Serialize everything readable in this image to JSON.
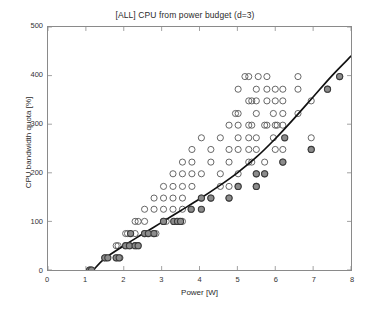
{
  "chart_data": {
    "type": "scatter",
    "title": "[ALL] CPU from power budget (d=3)",
    "xlabel": "Power [W]",
    "ylabel": "CPU bandwidth quota [%]",
    "xlim": [
      0,
      8
    ],
    "ylim": [
      0,
      500
    ],
    "xticks": [
      0,
      1,
      2,
      3,
      4,
      5,
      6,
      7,
      8
    ],
    "yticks": [
      0,
      100,
      200,
      300,
      400,
      500
    ],
    "xtick_labels": [
      "0",
      "1",
      "2",
      "3",
      "4",
      "5",
      "6",
      "7",
      "8"
    ],
    "ytick_labels": [
      "0",
      "100",
      "200",
      "300",
      "400",
      "500"
    ],
    "grid": false,
    "legend": "none",
    "colors": {
      "open_marker_edge": "#555555",
      "filled_marker_face": "#8c8c8c",
      "filled_marker_edge": "#3a3a3a",
      "fit_curve": "#111111",
      "axis": "#8a8a8a",
      "background": "#ffffff",
      "text": "#2b2b2b"
    },
    "series": [
      {
        "name": "all samples",
        "marker": "open-circle",
        "points": [
          [
            1.1,
            0
          ],
          [
            1.15,
            0
          ],
          [
            1.5,
            25
          ],
          [
            1.55,
            25
          ],
          [
            1.8,
            25
          ],
          [
            1.85,
            25
          ],
          [
            1.9,
            25
          ],
          [
            1.8,
            50
          ],
          [
            1.85,
            50
          ],
          [
            2.05,
            50
          ],
          [
            2.15,
            50
          ],
          [
            2.3,
            50
          ],
          [
            2.38,
            50
          ],
          [
            2.05,
            75
          ],
          [
            2.1,
            75
          ],
          [
            2.3,
            75
          ],
          [
            2.55,
            75
          ],
          [
            2.62,
            75
          ],
          [
            2.78,
            75
          ],
          [
            2.85,
            75
          ],
          [
            2.3,
            100
          ],
          [
            2.38,
            100
          ],
          [
            2.55,
            100
          ],
          [
            3.05,
            100
          ],
          [
            3.12,
            100
          ],
          [
            3.4,
            100
          ],
          [
            3.48,
            100
          ],
          [
            3.55,
            100
          ],
          [
            2.55,
            125
          ],
          [
            2.8,
            125
          ],
          [
            3.05,
            125
          ],
          [
            3.3,
            125
          ],
          [
            3.55,
            125
          ],
          [
            3.78,
            125
          ],
          [
            2.8,
            148
          ],
          [
            3.05,
            148
          ],
          [
            3.3,
            148
          ],
          [
            3.55,
            148
          ],
          [
            4.05,
            148
          ],
          [
            4.3,
            148
          ],
          [
            4.78,
            148
          ],
          [
            3.05,
            172
          ],
          [
            3.3,
            172
          ],
          [
            3.55,
            172
          ],
          [
            3.8,
            172
          ],
          [
            4.55,
            172
          ],
          [
            4.78,
            172
          ],
          [
            5.02,
            172
          ],
          [
            5.5,
            172
          ],
          [
            3.3,
            198
          ],
          [
            3.55,
            198
          ],
          [
            3.8,
            198
          ],
          [
            4.05,
            198
          ],
          [
            4.55,
            198
          ],
          [
            5.02,
            198
          ],
          [
            5.5,
            198
          ],
          [
            5.72,
            198
          ],
          [
            3.55,
            222
          ],
          [
            3.8,
            222
          ],
          [
            4.3,
            222
          ],
          [
            4.78,
            222
          ],
          [
            5.3,
            222
          ],
          [
            5.38,
            222
          ],
          [
            5.72,
            222
          ],
          [
            6.2,
            222
          ],
          [
            3.8,
            248
          ],
          [
            4.3,
            248
          ],
          [
            4.78,
            248
          ],
          [
            5.02,
            248
          ],
          [
            5.3,
            248
          ],
          [
            5.5,
            248
          ],
          [
            6.0,
            248
          ],
          [
            6.2,
            248
          ],
          [
            6.95,
            248
          ],
          [
            4.05,
            272
          ],
          [
            4.55,
            272
          ],
          [
            5.02,
            272
          ],
          [
            5.3,
            272
          ],
          [
            5.5,
            272
          ],
          [
            5.95,
            272
          ],
          [
            6.95,
            272
          ],
          [
            4.78,
            298
          ],
          [
            5.02,
            298
          ],
          [
            5.3,
            298
          ],
          [
            5.38,
            298
          ],
          [
            5.72,
            298
          ],
          [
            5.78,
            298
          ],
          [
            6.0,
            298
          ],
          [
            6.05,
            298
          ],
          [
            6.2,
            298
          ],
          [
            4.95,
            322
          ],
          [
            5.02,
            322
          ],
          [
            5.5,
            322
          ],
          [
            5.95,
            322
          ],
          [
            6.2,
            322
          ],
          [
            6.6,
            322
          ],
          [
            5.3,
            348
          ],
          [
            5.38,
            348
          ],
          [
            5.5,
            348
          ],
          [
            5.78,
            348
          ],
          [
            6.0,
            348
          ],
          [
            6.2,
            348
          ],
          [
            6.95,
            348
          ],
          [
            5.02,
            372
          ],
          [
            5.5,
            372
          ],
          [
            5.78,
            372
          ],
          [
            6.0,
            372
          ],
          [
            6.2,
            372
          ],
          [
            6.6,
            372
          ],
          [
            7.38,
            372
          ],
          [
            5.2,
            398
          ],
          [
            5.3,
            398
          ],
          [
            5.55,
            398
          ],
          [
            5.78,
            398
          ],
          [
            6.6,
            398
          ],
          [
            7.7,
            398
          ]
        ]
      },
      {
        "name": "selected operating points",
        "marker": "filled-circle",
        "points": [
          [
            1.1,
            0
          ],
          [
            1.15,
            0
          ],
          [
            1.5,
            25
          ],
          [
            1.58,
            25
          ],
          [
            1.8,
            25
          ],
          [
            1.88,
            25
          ],
          [
            2.05,
            50
          ],
          [
            2.15,
            50
          ],
          [
            2.3,
            50
          ],
          [
            2.38,
            50
          ],
          [
            2.18,
            75
          ],
          [
            2.55,
            75
          ],
          [
            2.65,
            75
          ],
          [
            2.8,
            75
          ],
          [
            3.05,
            100
          ],
          [
            3.32,
            100
          ],
          [
            3.42,
            100
          ],
          [
            3.5,
            100
          ],
          [
            3.78,
            125
          ],
          [
            4.05,
            125
          ],
          [
            4.05,
            148
          ],
          [
            4.3,
            148
          ],
          [
            4.78,
            148
          ],
          [
            5.02,
            172
          ],
          [
            5.5,
            172
          ],
          [
            5.5,
            198
          ],
          [
            5.72,
            198
          ],
          [
            6.2,
            222
          ],
          [
            6.95,
            248
          ],
          [
            6.25,
            272
          ],
          [
            7.38,
            372
          ],
          [
            7.7,
            398
          ]
        ]
      }
    ],
    "fit_curve": {
      "name": "cubic fit (d=3)",
      "x": [
        1.2,
        1.5,
        2.0,
        2.5,
        3.0,
        3.5,
        4.0,
        4.5,
        5.0,
        5.5,
        6.0,
        6.5,
        7.0,
        7.5,
        8.0
      ],
      "y": [
        0,
        24,
        50,
        74,
        98,
        122,
        146,
        172,
        200,
        232,
        270,
        312,
        356,
        400,
        440
      ]
    }
  }
}
